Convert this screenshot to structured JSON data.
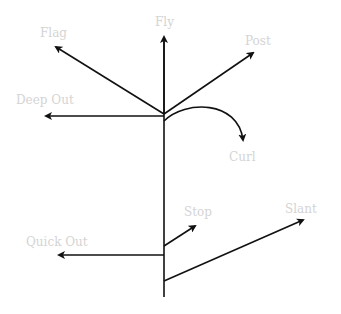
{
  "diagram": {
    "line_color": "#111111",
    "label_color": "#d4d4d4",
    "routes": [
      {
        "name": "Flag",
        "label": "Flag"
      },
      {
        "name": "Fly",
        "label": "Fly"
      },
      {
        "name": "Post",
        "label": "Post"
      },
      {
        "name": "Deep Out",
        "label": "Deep Out"
      },
      {
        "name": "Curl",
        "label": "Curl"
      },
      {
        "name": "Stop",
        "label": "Stop"
      },
      {
        "name": "Slant",
        "label": "Slant"
      },
      {
        "name": "Quick Out",
        "label": "Quick Out"
      }
    ]
  }
}
